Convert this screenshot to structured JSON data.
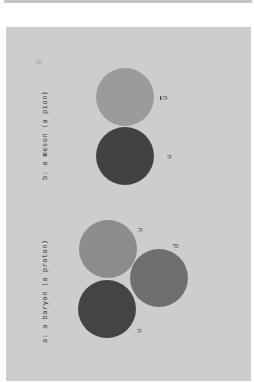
{
  "diagram": {
    "panel_a": {
      "label": "a:  a baryon (a proton)",
      "quarks": [
        {
          "label": "u",
          "color": "#8c8c8c"
        },
        {
          "label": "d",
          "color": "#6f6f6f"
        },
        {
          "label": "u",
          "color": "#444444"
        }
      ]
    },
    "panel_b": {
      "label": "b:  a meson (a pion)",
      "quarks": [
        {
          "label": "ū",
          "color": "#9b9b9b"
        },
        {
          "label": "u",
          "color": "#424242"
        }
      ]
    }
  }
}
